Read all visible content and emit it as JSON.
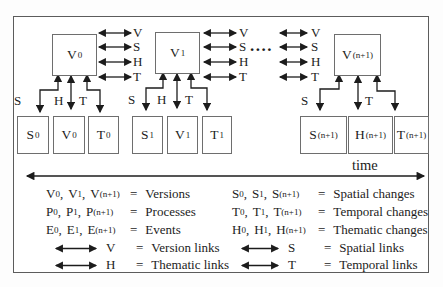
{
  "figure": {
    "version_boxes": [
      {
        "base": "V",
        "sub": "0"
      },
      {
        "base": "V",
        "sub": "1"
      },
      {
        "base": "V",
        "sub": "(n+1)"
      }
    ],
    "link_letter_columns": [
      {
        "letters": [
          "V",
          "S",
          "H",
          "T"
        ]
      },
      {
        "letters": [
          "V",
          "S",
          "H",
          "T"
        ]
      },
      {
        "letters": [
          "V",
          "S",
          "H",
          "T"
        ]
      }
    ],
    "ellipsis": "....",
    "groups": [
      {
        "s_label": "S",
        "h_label": "H",
        "t_label": "T",
        "change_boxes": [
          {
            "base": "S",
            "sub": "0"
          },
          {
            "base": "V",
            "sub": "0"
          },
          {
            "base": "T",
            "sub": "0"
          }
        ]
      },
      {
        "s_label": "S",
        "h_label": "H",
        "t_label": "T",
        "change_boxes": [
          {
            "base": "S",
            "sub": "1"
          },
          {
            "base": "V",
            "sub": "1"
          },
          {
            "base": "T",
            "sub": "1"
          }
        ]
      },
      {
        "s_label": "S",
        "t_label": "T",
        "change_boxes": [
          {
            "base": "S",
            "sub": "(n+1)"
          },
          {
            "base": "H",
            "sub": "(n+1)"
          },
          {
            "base": "T",
            "sub": "(n+1)"
          }
        ]
      }
    ],
    "time_label": "time"
  },
  "legend": {
    "comma": ",",
    "left_rows": [
      {
        "t1": {
          "base": "V",
          "sub": "0"
        },
        "t2": {
          "base": "V",
          "sub": "1"
        },
        "t3": {
          "base": "V",
          "sub": "(n+1)"
        },
        "eq": "=",
        "desc": "Versions"
      },
      {
        "t1": {
          "base": "P",
          "sub": "0"
        },
        "t2": {
          "base": "P",
          "sub": "1"
        },
        "t3": {
          "base": "P",
          "sub": "(n+1)"
        },
        "eq": "=",
        "desc": "Processes"
      },
      {
        "t1": {
          "base": "E",
          "sub": "0"
        },
        "t2": {
          "base": "E",
          "sub": "1"
        },
        "t3": {
          "base": "E",
          "sub": "(n+1)"
        },
        "eq": "=",
        "desc": "Events"
      },
      {
        "symbol": "V",
        "eq": "=",
        "desc": "Version links"
      },
      {
        "symbol": "H",
        "eq": "=",
        "desc": "Thematic links"
      }
    ],
    "right_rows": [
      {
        "t1": {
          "base": "S",
          "sub": "0"
        },
        "t2": {
          "base": "S",
          "sub": "1"
        },
        "t3": {
          "base": "S",
          "sub": "(n+1)"
        },
        "eq": "=",
        "desc": "Spatial changes"
      },
      {
        "t1": {
          "base": "T",
          "sub": "0"
        },
        "t2": {
          "base": "T",
          "sub": "1"
        },
        "t3": {
          "base": "T",
          "sub": "(n+1)"
        },
        "eq": "=",
        "desc": "Temporal changes"
      },
      {
        "t1": {
          "base": "H",
          "sub": "0"
        },
        "t2": {
          "base": "H",
          "sub": "1"
        },
        "t3": {
          "base": "H",
          "sub": "(n+1)"
        },
        "eq": "=",
        "desc": "Thematic changes"
      },
      {
        "symbol": "S",
        "eq": "=",
        "desc": "Spatial links"
      },
      {
        "symbol": "T",
        "eq": "=",
        "desc": "Temporal links"
      }
    ]
  }
}
